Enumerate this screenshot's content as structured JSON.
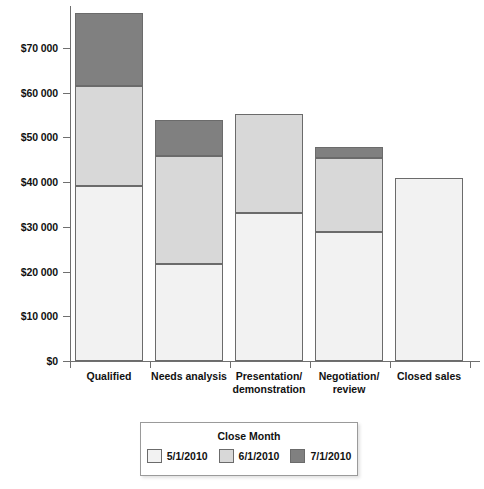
{
  "chart_data": {
    "type": "bar",
    "stacked": true,
    "title": "",
    "xlabel": "",
    "ylabel": "",
    "ylim": [
      0,
      78000
    ],
    "grid": false,
    "legend_position": "bottom",
    "categories": [
      "Qualified",
      "Needs analysis",
      "Presentation/\ndemonstration",
      "Negotiation/\nreview",
      "Closed sales"
    ],
    "series": [
      {
        "name": "5/1/2010",
        "color": "#f2f2f2",
        "values": [
          39200,
          21700,
          33200,
          28900,
          41000
        ]
      },
      {
        "name": "6/1/2010",
        "color": "#d8d8d8",
        "values": [
          22200,
          24100,
          22100,
          16500,
          0
        ]
      },
      {
        "name": "7/1/2010",
        "color": "#808080",
        "values": [
          16400,
          8200,
          0,
          2400,
          0
        ]
      }
    ],
    "totals": [
      77800,
      54000,
      55300,
      47800,
      41000
    ],
    "ytick_labels": [
      "$0",
      "$10 000",
      "$20 000",
      "$30 000",
      "$40 000",
      "$50 000",
      "$60 000",
      "$70 000"
    ],
    "ytick_values": [
      0,
      10000,
      20000,
      30000,
      40000,
      50000,
      60000,
      70000
    ]
  },
  "categories": [
    {
      "line1": "Qualified",
      "line2": ""
    },
    {
      "line1": "Needs analysis",
      "line2": ""
    },
    {
      "line1": "Presentation/",
      "line2": "demonstration"
    },
    {
      "line1": "Negotiation/",
      "line2": "review"
    },
    {
      "line1": "Closed sales",
      "line2": ""
    }
  ],
  "legend": {
    "title": "Close Month",
    "items": [
      {
        "label": "5/1/2010",
        "color": "#f2f2f2"
      },
      {
        "label": "6/1/2010",
        "color": "#d8d8d8"
      },
      {
        "label": "7/1/2010",
        "color": "#808080"
      }
    ]
  },
  "axis": {
    "line_color": "#6f6f6f",
    "bar_border_color": "#6b6b6b"
  }
}
